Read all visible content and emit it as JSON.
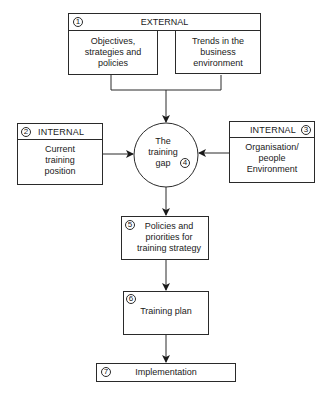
{
  "diagram": {
    "external": {
      "number": "1",
      "header": "EXTERNAL",
      "left_box": "Objectives,\nstrategies and\npolicies",
      "right_box": "Trends in the\nbusiness\nenvironment"
    },
    "internal_left": {
      "number": "2",
      "header": "INTERNAL",
      "body": "Current\ntraining\nposition"
    },
    "internal_right": {
      "number": "3",
      "header": "INTERNAL",
      "body": "Organisation/\npeople\nEnvironment"
    },
    "gap": {
      "number": "4",
      "label": "The\ntraining\ngap"
    },
    "policies": {
      "number": "5",
      "label": "Policies and\npriorities for\ntraining strategy"
    },
    "plan": {
      "number": "6",
      "label": "Training plan"
    },
    "implementation": {
      "number": "7",
      "label": "Implementation"
    },
    "colors": {
      "line": "#2a2a2a",
      "background": "#ffffff"
    }
  }
}
